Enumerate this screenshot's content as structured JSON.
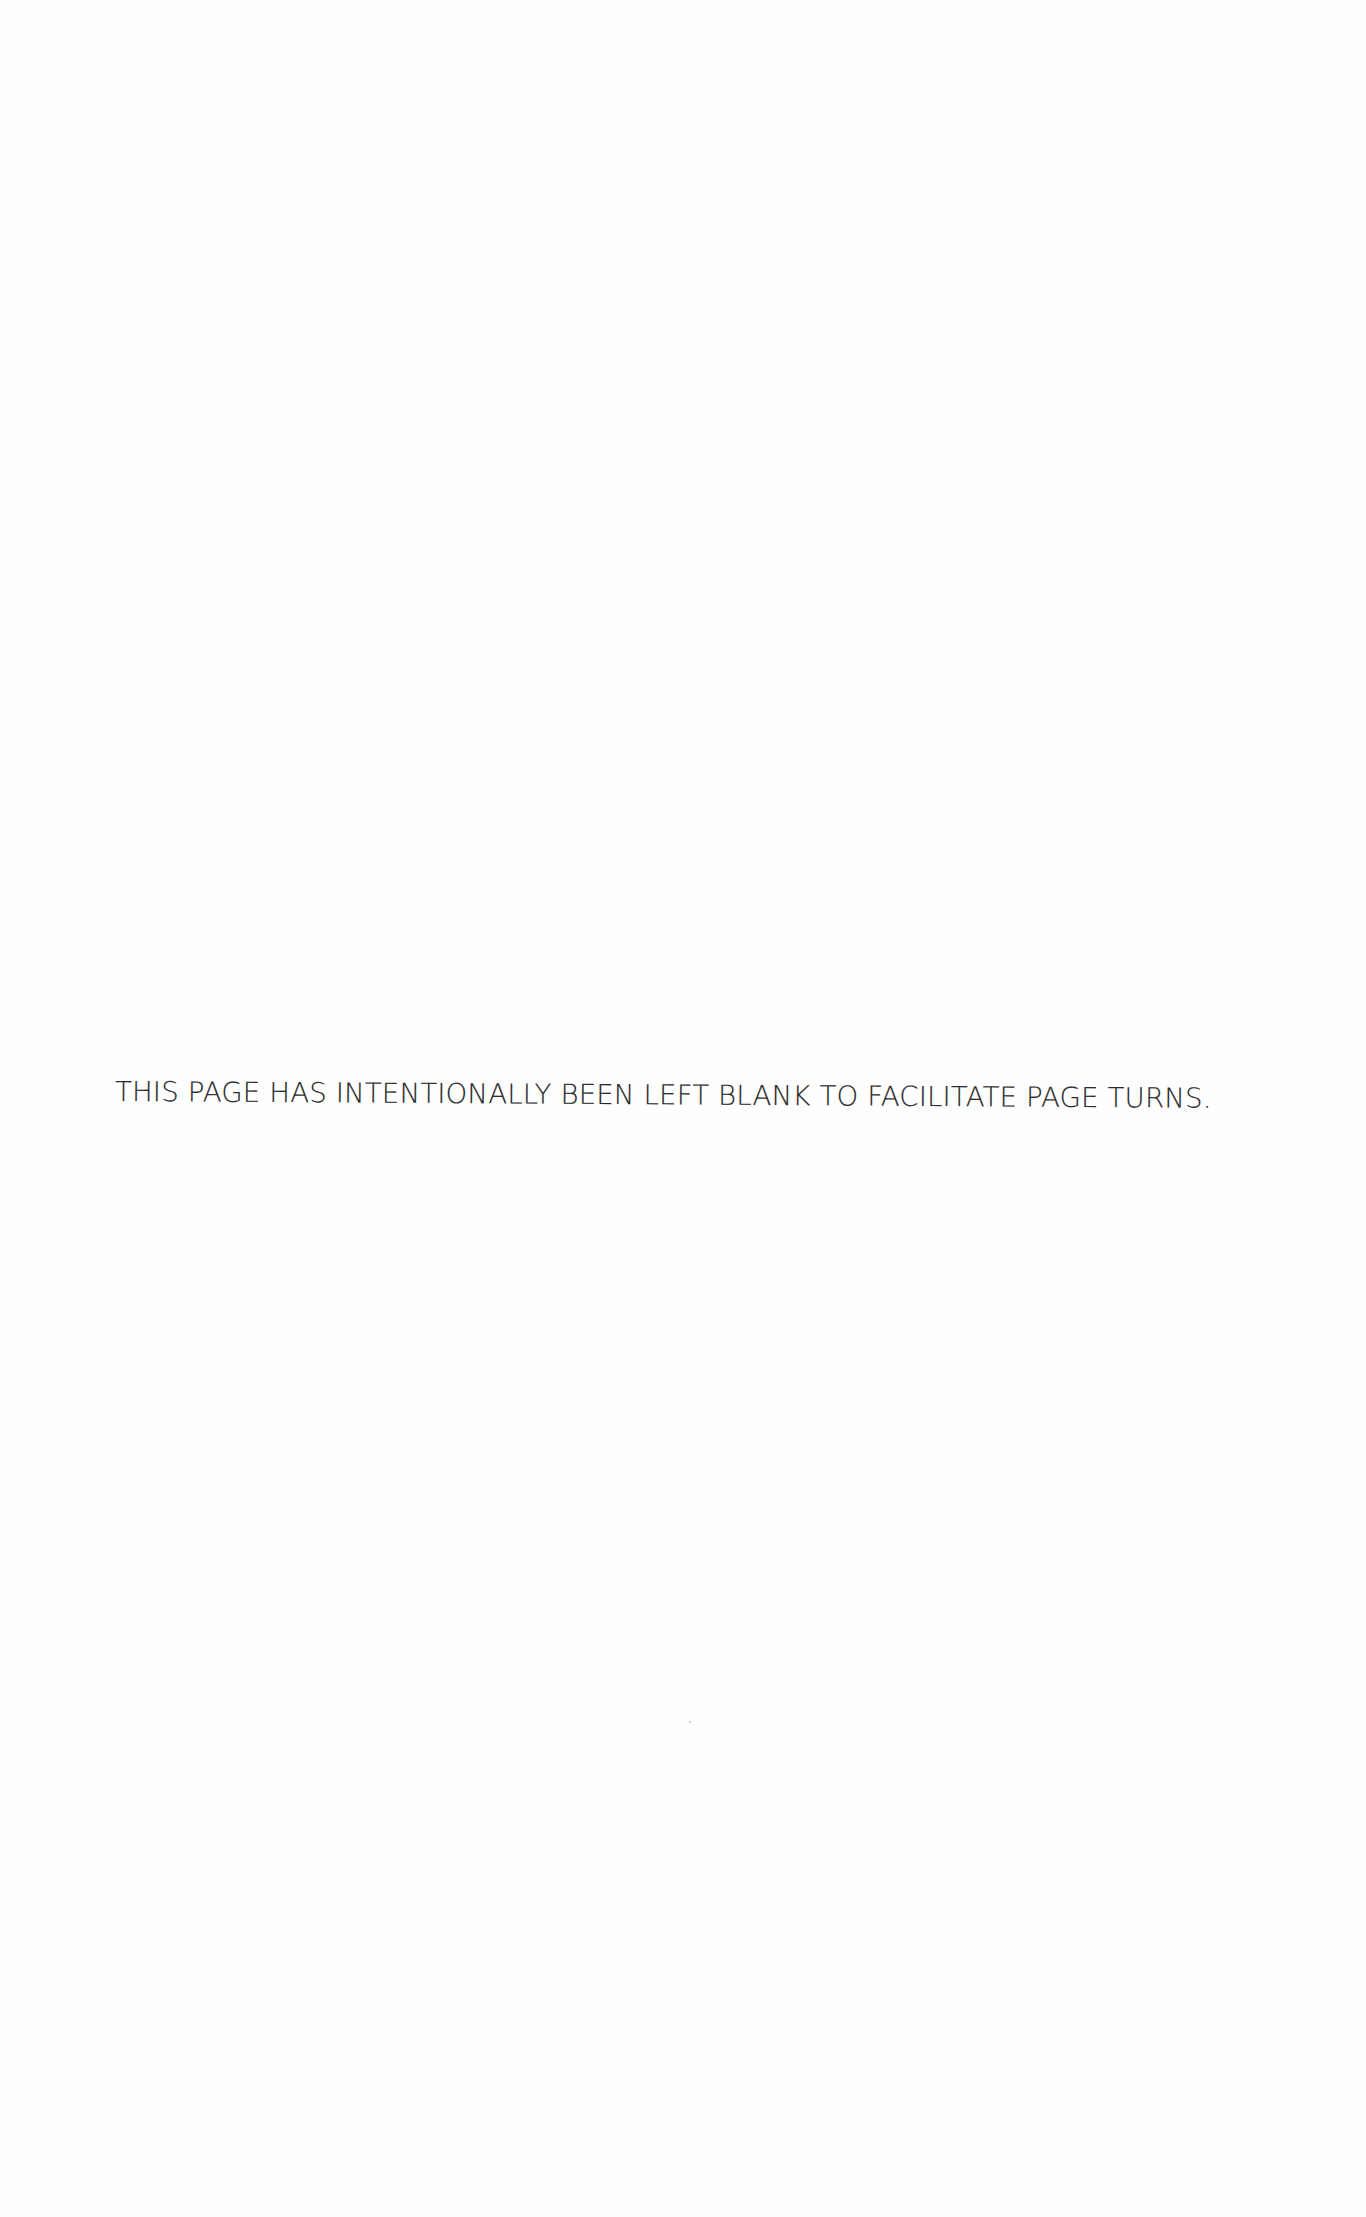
{
  "page": {
    "background_color": "#fefefe",
    "notice_text": "THIS PAGE HAS INTENTIONALLY BEEN LEFT BLANK TO FACILITATE PAGE TURNS.",
    "text_color": "#2b2b2b"
  }
}
